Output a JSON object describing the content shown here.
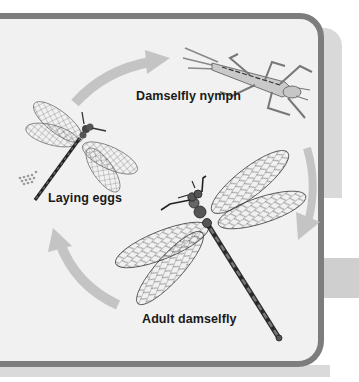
{
  "diagram": {
    "stages": [
      {
        "id": "nymph",
        "label": "Damselfly nymph"
      },
      {
        "id": "adult",
        "label": "Adult damselfly"
      },
      {
        "id": "eggs",
        "label": "Laying eggs"
      }
    ],
    "arrows": [
      {
        "from": "eggs",
        "to": "nymph",
        "direction": "clockwise"
      },
      {
        "from": "nymph",
        "to": "adult",
        "direction": "clockwise"
      },
      {
        "from": "adult",
        "to": "eggs",
        "direction": "clockwise"
      }
    ],
    "colors": {
      "panel_background": "#f1f1f1",
      "frame_border": "#7d7d7d",
      "arrow": "#c4c4c4",
      "shadow": "#d9d9d9",
      "label_text": "#1a1a1a"
    }
  }
}
